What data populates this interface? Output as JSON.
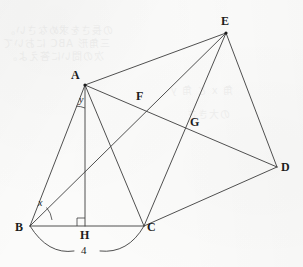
{
  "figure": {
    "background_color": "#fbfbfa",
    "line_color": "#3c3c3c",
    "label_color": "#1d1d1d",
    "width": 303,
    "height": 267,
    "vertices": [
      {
        "id": "A",
        "label": "A",
        "x": 85,
        "y": 85,
        "dot": true
      },
      {
        "id": "B",
        "label": "B",
        "x": 30,
        "y": 226,
        "dot": false
      },
      {
        "id": "C",
        "label": "C",
        "x": 144,
        "y": 226,
        "dot": false
      },
      {
        "id": "D",
        "label": "D",
        "x": 277,
        "y": 167,
        "dot": false
      },
      {
        "id": "E",
        "label": "E",
        "x": 226,
        "y": 33,
        "dot": true
      },
      {
        "id": "F",
        "label": "F",
        "x": 143,
        "y": 103,
        "dot": false
      },
      {
        "id": "G",
        "label": "G",
        "x": 187,
        "y": 128,
        "dot": false
      },
      {
        "id": "H",
        "label": "H",
        "x": 85,
        "y": 226,
        "dot": false
      }
    ],
    "segments": [
      {
        "from": "A",
        "to": "E"
      },
      {
        "from": "A",
        "to": "B"
      },
      {
        "from": "A",
        "to": "C"
      },
      {
        "from": "A",
        "to": "H"
      },
      {
        "from": "A",
        "to": "D"
      },
      {
        "from": "B",
        "to": "C"
      },
      {
        "from": "B",
        "to": "E"
      },
      {
        "from": "C",
        "to": "E"
      },
      {
        "from": "C",
        "to": "D"
      },
      {
        "from": "E",
        "to": "D"
      }
    ],
    "angles": [
      {
        "id": "x",
        "label": "x",
        "at": "B",
        "between": [
          "BA",
          "BC"
        ]
      },
      {
        "id": "y",
        "label": "y",
        "at": "A",
        "between": [
          "AB",
          "AH"
        ]
      }
    ],
    "right_angle": {
      "at": "H",
      "label": "right-angle-marker",
      "size": 8
    },
    "measure_arc": {
      "label": "4",
      "from": "B",
      "to": "C",
      "value": 4
    }
  }
}
